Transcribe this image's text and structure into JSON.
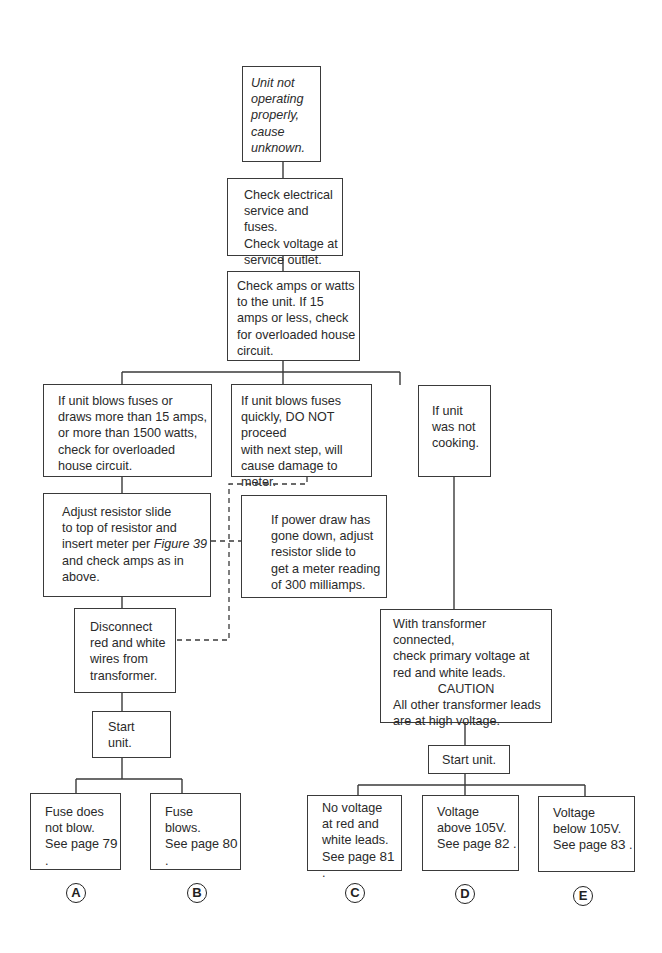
{
  "flowchart": {
    "start": {
      "lines": [
        "Unit not",
        "operating",
        "properly,",
        "cause",
        "unknown."
      ]
    },
    "step_check_service": {
      "lines": [
        "Check electrical",
        "service and fuses.",
        "Check voltage at",
        "service outlet."
      ]
    },
    "step_check_amps": {
      "lines": [
        "Check amps or watts",
        "to the unit. If 15",
        "amps or less, check",
        "for overloaded house",
        "circuit."
      ]
    },
    "branch_blows_fuses": {
      "lines": [
        "If unit blows fuses or",
        "draws more than 15 amps,",
        "or more than 1500 watts,",
        "check for overloaded",
        "house circuit."
      ]
    },
    "branch_blows_quickly": {
      "lines": [
        "If unit blows fuses",
        "quickly, DO NOT proceed",
        "with next step, will",
        "cause damage to meter."
      ]
    },
    "branch_not_cooking": {
      "lines": [
        "If unit",
        "was not",
        "cooking."
      ]
    },
    "step_adjust_resistor": {
      "lines": [
        "Adjust resistor slide",
        "to top of resistor and",
        "insert meter per",
        "and check amps as in",
        "above."
      ],
      "figure_ref": "Figure 39"
    },
    "step_power_draw": {
      "lines": [
        "If power draw has",
        "gone down, adjust",
        "resistor slide to",
        "get a meter reading",
        "of 300 milliamps."
      ]
    },
    "step_disconnect": {
      "lines": [
        "Disconnect",
        "red and white",
        "wires from",
        "transformer."
      ]
    },
    "step_start_unit_left": {
      "lines": [
        "Start",
        "unit."
      ]
    },
    "step_transformer": {
      "lines": [
        "With transformer connected,",
        "check primary voltage at",
        "red and white leads.",
        "CAUTION",
        "All other transformer leads",
        "are at high voltage."
      ]
    },
    "step_start_unit_right": {
      "lines": [
        "Start unit."
      ]
    },
    "outcomes": [
      {
        "id": "A",
        "lines": [
          "Fuse does",
          "not blow.",
          "See page"
        ],
        "page": "79"
      },
      {
        "id": "B",
        "lines": [
          "Fuse",
          "blows.",
          "See page"
        ],
        "page": "80"
      },
      {
        "id": "C",
        "lines": [
          "No voltage",
          "at red and",
          "white leads.",
          "See page"
        ],
        "page": "81"
      },
      {
        "id": "D",
        "lines": [
          "Voltage",
          "above 105V.",
          "See page"
        ],
        "page": "82"
      },
      {
        "id": "E",
        "lines": [
          "Voltage",
          "below 105V.",
          "See page"
        ],
        "page": "83"
      }
    ],
    "colors": {
      "line": "#3a3a3a",
      "text": "#2a2a2a",
      "background": "#ffffff"
    }
  }
}
